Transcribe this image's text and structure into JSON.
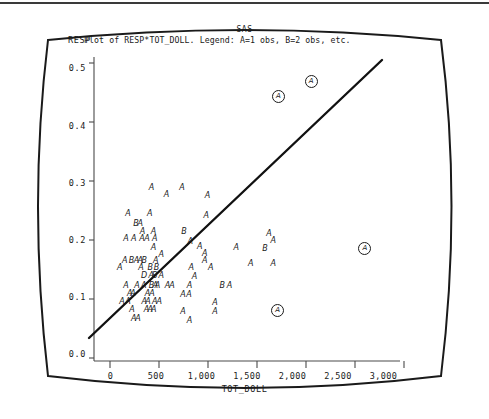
{
  "figure": {
    "system_label": "SAS",
    "title": "Plot of RESP*TOT_DOLL. Legend: A=1 obs, B=2 obs, etc.",
    "yaxis_name": "RESP",
    "xaxis_name": "TOT_DOLL",
    "frame_style": "rounded-crt-screen"
  },
  "chart_data": {
    "type": "scatter",
    "title": "Plot of RESP*TOT_DOLL. Legend: A=1 obs, B=2 obs, etc.",
    "subtitle": "SAS",
    "xlabel": "TOT_DOLL",
    "ylabel": "RESP",
    "xlim": [
      -180,
      3180
    ],
    "ylim": [
      -0.012,
      0.52
    ],
    "grid": false,
    "legend": "A=1 obs, B=2 obs, etc.",
    "legend_position": "in-title",
    "xticks": [
      0,
      500,
      1000,
      1500,
      2000,
      2500,
      3000
    ],
    "xtick_labels": [
      "0",
      "500",
      "1,000",
      "1,500",
      "2,000",
      "2,500",
      "3,000"
    ],
    "yticks": [
      0.0,
      0.1,
      0.2,
      0.3,
      0.4,
      0.5
    ],
    "ytick_labels": [
      "0.0",
      "0.1",
      "0.2",
      "0.3",
      "0.4",
      "0.5"
    ],
    "annotations": [
      {
        "label": "A",
        "x": 1840,
        "y": 0.452,
        "circled": true
      },
      {
        "label": "A",
        "x": 2200,
        "y": 0.478,
        "circled": true
      },
      {
        "label": "A",
        "x": 2790,
        "y": 0.186,
        "circled": true
      },
      {
        "label": "A",
        "x": 1830,
        "y": 0.077,
        "circled": true
      }
    ],
    "fit_line": {
      "type": "linear-regression",
      "x_start": -40,
      "y_start": 0.027,
      "x_end": 2760,
      "y_end": 0.497
    },
    "points": [
      {
        "label": "A",
        "x": 455,
        "y": 0.29
      },
      {
        "label": "A",
        "x": 790,
        "y": 0.291
      },
      {
        "label": "A",
        "x": 620,
        "y": 0.279
      },
      {
        "label": "A",
        "x": 1070,
        "y": 0.277
      },
      {
        "label": "A",
        "x": 195,
        "y": 0.246
      },
      {
        "label": "A",
        "x": 435,
        "y": 0.246
      },
      {
        "label": "A",
        "x": 1055,
        "y": 0.241
      },
      {
        "label": "B",
        "x": 285,
        "y": 0.228
      },
      {
        "label": "A",
        "x": 330,
        "y": 0.228
      },
      {
        "label": "A",
        "x": 355,
        "y": 0.214
      },
      {
        "label": "A",
        "x": 475,
        "y": 0.214
      },
      {
        "label": "B",
        "x": 810,
        "y": 0.214
      },
      {
        "label": "A",
        "x": 175,
        "y": 0.201
      },
      {
        "label": "A",
        "x": 260,
        "y": 0.201
      },
      {
        "label": "A",
        "x": 350,
        "y": 0.201
      },
      {
        "label": "A",
        "x": 405,
        "y": 0.201
      },
      {
        "label": "A",
        "x": 490,
        "y": 0.201
      },
      {
        "label": "A",
        "x": 1745,
        "y": 0.211
      },
      {
        "label": "A",
        "x": 880,
        "y": 0.197
      },
      {
        "label": "A",
        "x": 1790,
        "y": 0.198
      },
      {
        "label": "A",
        "x": 475,
        "y": 0.186
      },
      {
        "label": "A",
        "x": 985,
        "y": 0.187
      },
      {
        "label": "A",
        "x": 1385,
        "y": 0.186
      },
      {
        "label": "B",
        "x": 1700,
        "y": 0.184
      },
      {
        "label": "A",
        "x": 560,
        "y": 0.173
      },
      {
        "label": "A",
        "x": 1040,
        "y": 0.175
      },
      {
        "label": "A",
        "x": 160,
        "y": 0.163
      },
      {
        "label": "B",
        "x": 235,
        "y": 0.163
      },
      {
        "label": "A",
        "x": 290,
        "y": 0.163
      },
      {
        "label": "A",
        "x": 330,
        "y": 0.163
      },
      {
        "label": "B",
        "x": 375,
        "y": 0.163
      },
      {
        "label": "A",
        "x": 500,
        "y": 0.163
      },
      {
        "label": "A",
        "x": 1040,
        "y": 0.163
      },
      {
        "label": "A",
        "x": 105,
        "y": 0.151
      },
      {
        "label": "A",
        "x": 340,
        "y": 0.151
      },
      {
        "label": "B",
        "x": 440,
        "y": 0.151
      },
      {
        "label": "B",
        "x": 510,
        "y": 0.151
      },
      {
        "label": "A",
        "x": 890,
        "y": 0.151
      },
      {
        "label": "A",
        "x": 1105,
        "y": 0.151
      },
      {
        "label": "A",
        "x": 1545,
        "y": 0.157
      },
      {
        "label": "A",
        "x": 1790,
        "y": 0.157
      },
      {
        "label": "D",
        "x": 370,
        "y": 0.136
      },
      {
        "label": "A",
        "x": 450,
        "y": 0.136
      },
      {
        "label": "B",
        "x": 490,
        "y": 0.136
      },
      {
        "label": "A",
        "x": 560,
        "y": 0.136
      },
      {
        "label": "A",
        "x": 925,
        "y": 0.135
      },
      {
        "label": "A",
        "x": 175,
        "y": 0.12
      },
      {
        "label": "A",
        "x": 295,
        "y": 0.12
      },
      {
        "label": "A",
        "x": 370,
        "y": 0.12
      },
      {
        "label": "B",
        "x": 455,
        "y": 0.12
      },
      {
        "label": "A",
        "x": 495,
        "y": 0.12
      },
      {
        "label": "A",
        "x": 520,
        "y": 0.12
      },
      {
        "label": "A",
        "x": 630,
        "y": 0.12
      },
      {
        "label": "A",
        "x": 680,
        "y": 0.12
      },
      {
        "label": "A",
        "x": 870,
        "y": 0.12
      },
      {
        "label": "B",
        "x": 1230,
        "y": 0.12
      },
      {
        "label": "A",
        "x": 1310,
        "y": 0.12
      },
      {
        "label": "A",
        "x": 215,
        "y": 0.106
      },
      {
        "label": "A",
        "x": 250,
        "y": 0.106
      },
      {
        "label": "A",
        "x": 410,
        "y": 0.106
      },
      {
        "label": "A",
        "x": 460,
        "y": 0.106
      },
      {
        "label": "A",
        "x": 800,
        "y": 0.104
      },
      {
        "label": "A",
        "x": 865,
        "y": 0.104
      },
      {
        "label": "A",
        "x": 130,
        "y": 0.092
      },
      {
        "label": "A",
        "x": 195,
        "y": 0.092
      },
      {
        "label": "A",
        "x": 375,
        "y": 0.092
      },
      {
        "label": "A",
        "x": 415,
        "y": 0.092
      },
      {
        "label": "A",
        "x": 490,
        "y": 0.092
      },
      {
        "label": "A",
        "x": 540,
        "y": 0.092
      },
      {
        "label": "A",
        "x": 1150,
        "y": 0.09
      },
      {
        "label": "A",
        "x": 240,
        "y": 0.077
      },
      {
        "label": "A",
        "x": 400,
        "y": 0.077
      },
      {
        "label": "A",
        "x": 440,
        "y": 0.077
      },
      {
        "label": "A",
        "x": 480,
        "y": 0.077
      },
      {
        "label": "A",
        "x": 800,
        "y": 0.074
      },
      {
        "label": "A",
        "x": 1150,
        "y": 0.074
      },
      {
        "label": "A",
        "x": 260,
        "y": 0.062
      },
      {
        "label": "A",
        "x": 305,
        "y": 0.062
      },
      {
        "label": "A",
        "x": 870,
        "y": 0.058
      }
    ]
  }
}
